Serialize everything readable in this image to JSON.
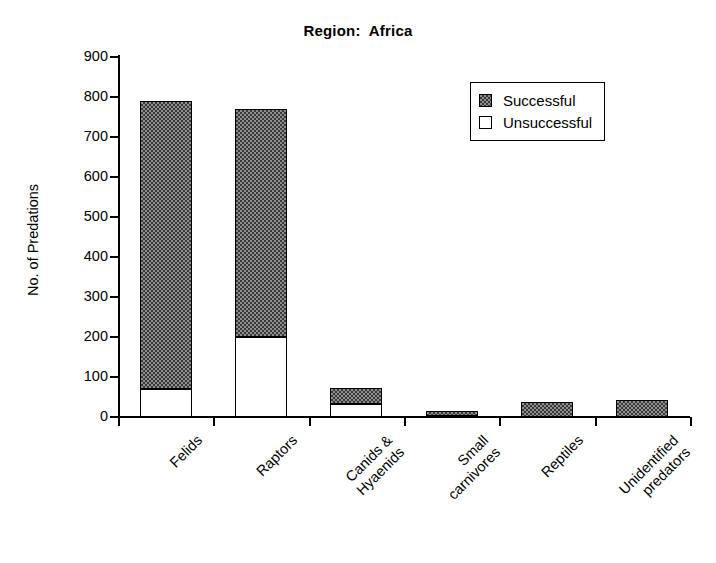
{
  "chart_data": {
    "type": "bar",
    "stacked": true,
    "title": "Region:  Africa",
    "xlabel": "",
    "ylabel": "No. of Predations",
    "ylim": [
      0,
      900
    ],
    "yticks": [
      0,
      100,
      200,
      300,
      400,
      500,
      600,
      700,
      800,
      900
    ],
    "grid": false,
    "legend_position": "top-right",
    "categories": [
      "Felids",
      "Raptors",
      "Canids &\nHyaenids",
      "Small\ncarnivores",
      "Reptiles",
      "Unidentified\npredators"
    ],
    "series": [
      {
        "name": "Unsuccessful",
        "color": "#ffffff",
        "values": [
          70,
          200,
          32,
          3,
          0,
          0
        ]
      },
      {
        "name": "Successful",
        "color": "#8d8d8d",
        "values": [
          720,
          570,
          40,
          12,
          38,
          42
        ]
      }
    ],
    "totals": [
      790,
      770,
      72,
      15,
      38,
      42
    ]
  },
  "legend": {
    "items": [
      {
        "label": "Successful",
        "swatch": "successful"
      },
      {
        "label": "Unsuccessful",
        "swatch": "unsuccessful"
      }
    ]
  }
}
